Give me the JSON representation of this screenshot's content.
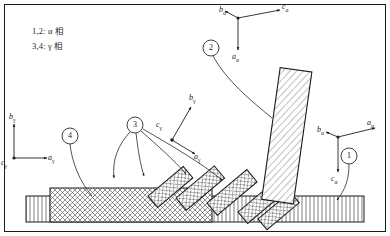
{
  "figure": {
    "background_color": "#ffffff",
    "line_color": "#1a1a1a",
    "hatch_color": "#3a3a3a"
  },
  "legend": {
    "line1": "1,2: α 相",
    "line2": "3,4: γ 相"
  },
  "axes": [
    {
      "id": "alpha-top",
      "origin": [
        238,
        18
      ],
      "labels": [
        {
          "name": "b-alpha",
          "text": "b",
          "sub": "α",
          "x": 219,
          "y": 5
        },
        {
          "name": "c-alpha",
          "text": "c",
          "sub": "α",
          "x": 285,
          "y": 3
        },
        {
          "name": "a-alpha",
          "text": "a",
          "sub": "α",
          "x": 234,
          "y": 55
        }
      ]
    },
    {
      "id": "alpha-right",
      "origin": [
        338,
        137
      ],
      "labels": [
        {
          "name": "b-alpha",
          "text": "b",
          "sub": "α",
          "x": 320,
          "y": 126
        },
        {
          "name": "a-alpha",
          "text": "a",
          "sub": "α",
          "x": 369,
          "y": 120
        },
        {
          "name": "c-alpha",
          "text": "c",
          "sub": "α",
          "x": 333,
          "y": 177
        }
      ]
    },
    {
      "id": "gamma-left",
      "origin": [
        14,
        158
      ],
      "labels": [
        {
          "name": "b-gamma",
          "text": "b",
          "sub": "γ",
          "x": 8,
          "y": 114
        },
        {
          "name": "a-gamma",
          "text": "a",
          "sub": "γ",
          "x": 49,
          "y": 155
        },
        {
          "name": "c-gamma",
          "text": "c",
          "sub": "γ",
          "x": 2,
          "y": 161
        }
      ]
    },
    {
      "id": "gamma-mid",
      "origin": [
        172,
        140
      ],
      "labels": [
        {
          "name": "b-gamma",
          "text": "b",
          "sub": "γ",
          "x": 189,
          "y": 95
        },
        {
          "name": "c-gamma",
          "text": "c",
          "sub": "γ",
          "x": 157,
          "y": 122
        },
        {
          "name": "a-gamma",
          "text": "a",
          "sub": "γ",
          "x": 196,
          "y": 155
        }
      ]
    }
  ],
  "callouts": [
    {
      "id": 1,
      "label": "1",
      "cx": 349,
      "cy": 156,
      "r": 8
    },
    {
      "id": 2,
      "label": "2",
      "cx": 211,
      "cy": 48,
      "r": 8
    },
    {
      "id": 3,
      "label": "3",
      "cx": 135,
      "cy": 125,
      "r": 8
    },
    {
      "id": 4,
      "label": "4",
      "cx": 70,
      "cy": 136,
      "r": 8
    }
  ],
  "structures": {
    "outer_frame": {
      "x": 4,
      "y": 4,
      "w": 382,
      "h": 228
    },
    "substrate_slab": {
      "x": 26,
      "y": 196,
      "w": 338,
      "h": 26,
      "hatch": "vertical-lines"
    },
    "gamma_block": {
      "x": 50,
      "y": 188,
      "w": 162,
      "h": 34,
      "hatch": "cross-hatch"
    },
    "alpha_lath": {
      "hatch": "diagonal-lines",
      "tilt_deg": 8
    },
    "gamma_plates": {
      "count": 5,
      "hatch": "cross-hatch",
      "tilt_deg": -40
    }
  }
}
